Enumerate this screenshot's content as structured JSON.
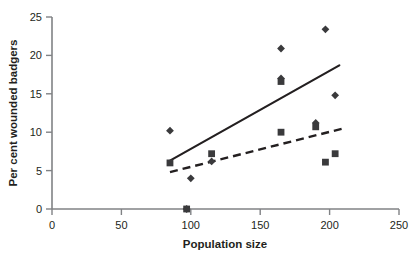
{
  "chart_data": {
    "type": "scatter",
    "title": "",
    "xlabel": "Population size",
    "ylabel": "Per cent wounded badgers",
    "xlim": [
      0,
      250
    ],
    "ylim": [
      0,
      25
    ],
    "xticks": [
      0,
      50,
      100,
      150,
      200,
      250
    ],
    "yticks": [
      0,
      5,
      10,
      15,
      20,
      25
    ],
    "xtick_labels": [
      "0",
      "50",
      "100",
      "150",
      "200",
      "250"
    ],
    "ytick_labels": [
      "0",
      "5",
      "10",
      "15",
      "20",
      "25"
    ],
    "grid": false,
    "legend": "none",
    "marker_color": "#3a3a3c",
    "line_color": "#231f20",
    "axis_color": "#808285",
    "series": [
      {
        "name": "diamonds",
        "marker": "diamond",
        "points": [
          {
            "x": 85,
            "y": 10.2
          },
          {
            "x": 100,
            "y": 4.0
          },
          {
            "x": 97,
            "y": 0.0
          },
          {
            "x": 115,
            "y": 6.2
          },
          {
            "x": 165,
            "y": 20.9
          },
          {
            "x": 165,
            "y": 17.0
          },
          {
            "x": 190,
            "y": 11.2
          },
          {
            "x": 197,
            "y": 23.4
          },
          {
            "x": 204,
            "y": 14.8
          }
        ]
      },
      {
        "name": "squares",
        "marker": "square",
        "points": [
          {
            "x": 85,
            "y": 6.0
          },
          {
            "x": 97,
            "y": 0.0
          },
          {
            "x": 115,
            "y": 7.2
          },
          {
            "x": 165,
            "y": 16.6
          },
          {
            "x": 165,
            "y": 10.0
          },
          {
            "x": 190,
            "y": 10.7
          },
          {
            "x": 197,
            "y": 6.1
          },
          {
            "x": 204,
            "y": 7.2
          }
        ]
      }
    ],
    "trend_lines": [
      {
        "name": "solid-trend-line",
        "style": "solid",
        "x1": 85,
        "y1": 6.3,
        "x2": 207,
        "y2": 18.7
      },
      {
        "name": "dashed-trend-line",
        "style": "dashed",
        "x1": 85,
        "y1": 4.8,
        "x2": 210,
        "y2": 10.5
      }
    ]
  }
}
